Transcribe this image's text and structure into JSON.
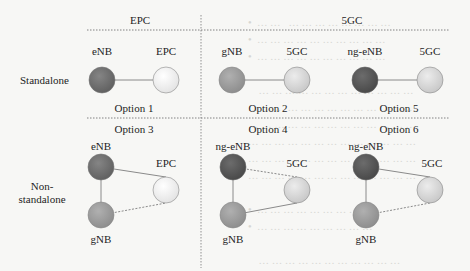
{
  "headers": {
    "epc": "EPC",
    "fivegc": "5GC"
  },
  "rows": {
    "standalone": "Standalone",
    "nonstandalone_line1": "Non-",
    "nonstandalone_line2": "standalone"
  },
  "options": {
    "o1": "Option 1",
    "o2": "Option 2",
    "o5": "Option 5",
    "o3": "Option 3",
    "o4": "Option 4",
    "o6": "Option 6"
  },
  "nodes": {
    "opt1_ran": "eNB",
    "opt1_core": "EPC",
    "opt2_ran": "gNB",
    "opt2_core": "5GC",
    "opt5_ran": "ng-eNB",
    "opt5_core": "5GC",
    "opt3_master": "eNB",
    "opt3_secondary": "gNB",
    "opt3_core": "EPC",
    "opt4_master": "ng-eNB",
    "opt4_secondary": "gNB",
    "opt4_core": "5GC",
    "opt6_master": "ng-eNB",
    "opt6_secondary": "gNB",
    "opt6_core": "5GC"
  },
  "colors": {
    "enb": "#6e6e6e",
    "ng_enb": "#5a5a5a",
    "gnb": "#9a9a9a",
    "epc": "#ededed",
    "fivegc": "#d4d4d4",
    "stroke": "#8a8a8a",
    "background": "#f7f7f5"
  },
  "ghost_text": "•  … …   … … … … … … … …\n•  … … … … … … … … … …\n•  … … … … … … … … … …\n\n    … … … … … … … … … … … …\n… … … … … … … … … … … … …\n… … … … … … … … … … … … …\n… … … … … … … … … … … … …\n… … … … … … … … … … … … …\n… … … … … … … … … … … … …\n\n•  … … … … … … … … …\n•  … … … … … … … … …\n\n    … … … … … … … … … … …\n… … … … … … … … … … … …"
}
